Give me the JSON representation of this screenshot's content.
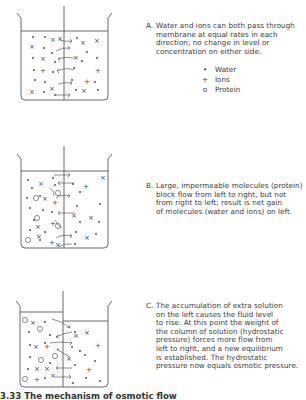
{
  "panels": [
    {
      "id": "A",
      "letter": "A.",
      "lines": [
        "Water and ions can both pass through",
        "membrane at equal rates in each",
        "direction; no change in level or",
        "concentration on either side."
      ]
    },
    {
      "id": "B",
      "letter": "B.",
      "lines": [
        "Large, impermeable molecules (protein)",
        "block flow from left to right, but not",
        "from right to left; result is net gain",
        "of molecules (water and ions) on left."
      ]
    },
    {
      "id": "C",
      "letter": "C.",
      "lines": [
        "The accumulation of extra solution",
        "on the left causes the fluid level",
        "to rise. At this point the weight of",
        "the column of solution (hydrostatic",
        "pressure) forces more flow from",
        "left to right, and a new equilibrium",
        "is established. The hydrostatic",
        "pressure now equals osmotic pressure."
      ]
    }
  ],
  "legend": [
    {
      "symbol": "•",
      "icon": "dot-icon",
      "label": "Water"
    },
    {
      "symbol": "+",
      "icon": "plus-icon",
      "label": "Ions"
    },
    {
      "symbol": "o",
      "icon": "circle-icon",
      "label": "Protein"
    }
  ],
  "caption": "3.33  The mechanism of osmotic flow",
  "colors": {
    "ink": "#3a3a3a",
    "background": "#ffffff"
  }
}
